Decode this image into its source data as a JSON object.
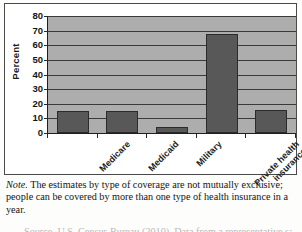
{
  "chart_data": {
    "type": "bar",
    "title": "",
    "xlabel": "",
    "ylabel": "Percent",
    "ylim": [
      0,
      80
    ],
    "ytick_step": 10,
    "grid": true,
    "legend": "none",
    "categories": [
      "Medicare",
      "Medicaid",
      "Military",
      "Private health insurance",
      "No insurance"
    ],
    "category_lines": [
      [
        "Medicare"
      ],
      [
        "Medicaid"
      ],
      [
        "Military"
      ],
      [
        "Private health",
        "insurance"
      ],
      [
        "No insurance"
      ]
    ],
    "values": [
      15,
      15,
      4,
      68,
      16
    ],
    "ytick_labels": [
      "80",
      "70",
      "60",
      "50",
      "40",
      "30",
      "20",
      "10",
      "0"
    ],
    "colors": {
      "bar_fill": "#585858",
      "bar_border": "#2b2b2b",
      "plot_background": "#adadad",
      "gridline": "#3a3a3a",
      "axis": "#1f1f1f",
      "text": "#141414"
    }
  },
  "note": {
    "label": "Note.",
    "text": " The estimates by type of coverage are not mutually exclusive; people can be covered by more than one type of health insurance in a year."
  },
  "clipped_source_line": "Source. U.S. Census Bureau (2010). Data from a representative sample"
}
